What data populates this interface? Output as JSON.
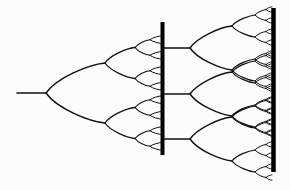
{
  "figure": {
    "background_color": "#fcfcfc",
    "stroke_color": "#111111",
    "barrier_color": "#000000",
    "canvas": {
      "width": 290,
      "height": 190
    }
  },
  "chart_data": {
    "type": "diagram",
    "subtitle": "",
    "xlabel": "",
    "ylabel": "",
    "grid": false,
    "legend": "none",
    "elements": {
      "root_stem": {
        "label": "root-stem",
        "x_start": 17,
        "x_end": 46,
        "y": 93
      },
      "left_tree": {
        "label": "left-cascade",
        "origin_x": 46,
        "origin_y": 93,
        "levels": 4,
        "tip_count": 16,
        "tip_x": 162,
        "level_spans_x": [
          46,
          105,
          135,
          150,
          162
        ],
        "level_half_heights": [
          30,
          15.5,
          7.8,
          3.9
        ],
        "stroke_widths": [
          1.5,
          1.3,
          1.1,
          1.0
        ]
      },
      "barrier_left": {
        "label": "barrier-left",
        "x": 162.5,
        "y_top": 22,
        "y_bottom": 155,
        "thickness": 4
      },
      "middle_stems": {
        "label": "middle-stems",
        "x_start": 164,
        "x_end": 190,
        "y_values": [
          48,
          94,
          139
        ]
      },
      "right_trees": {
        "label": "right-cascades",
        "count": 3,
        "origin_x": 190,
        "origin_y_values": [
          48,
          94,
          139
        ],
        "levels": 4,
        "tips_per_tree": 16,
        "tip_x": 272,
        "level_spans_x": [
          190,
          232,
          255,
          266,
          272
        ],
        "level_half_heights": [
          22,
          11,
          5.5,
          2.7
        ],
        "stroke_widths": [
          1.4,
          1.2,
          1.0,
          0.9
        ]
      },
      "barrier_right": {
        "label": "barrier-right",
        "x": 273.5,
        "y_top": 8,
        "y_bottom": 172,
        "thickness": 4.5
      }
    },
    "counts": {
      "total_left_tips": 16,
      "total_right_tips": 48,
      "barriers": 2,
      "middle_stems": 3
    }
  }
}
